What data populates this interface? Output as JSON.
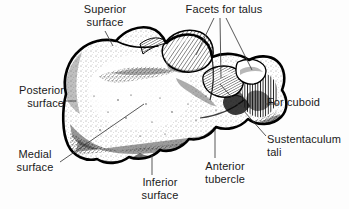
{
  "figure": {
    "view": "superior-lateral view of right calcaneus",
    "background_color": "#fdfdfd",
    "ink_color": "#000000",
    "text_color": "#1a1a1a",
    "width": 349,
    "height": 209
  },
  "labels": {
    "superior_surface": "Superior\nsurface",
    "facets_for_talus": "Facets for talus",
    "posterior_surface": "Posterior\nsurface",
    "for_cuboid": "For cuboid",
    "sustentaculum_tali": "Sustentaculum\ntali",
    "medial_surface": "Medial\nsurface",
    "inferior_surface": "Inferior\nsurface",
    "anterior_tubercle": "Anterior\ntubercle"
  }
}
